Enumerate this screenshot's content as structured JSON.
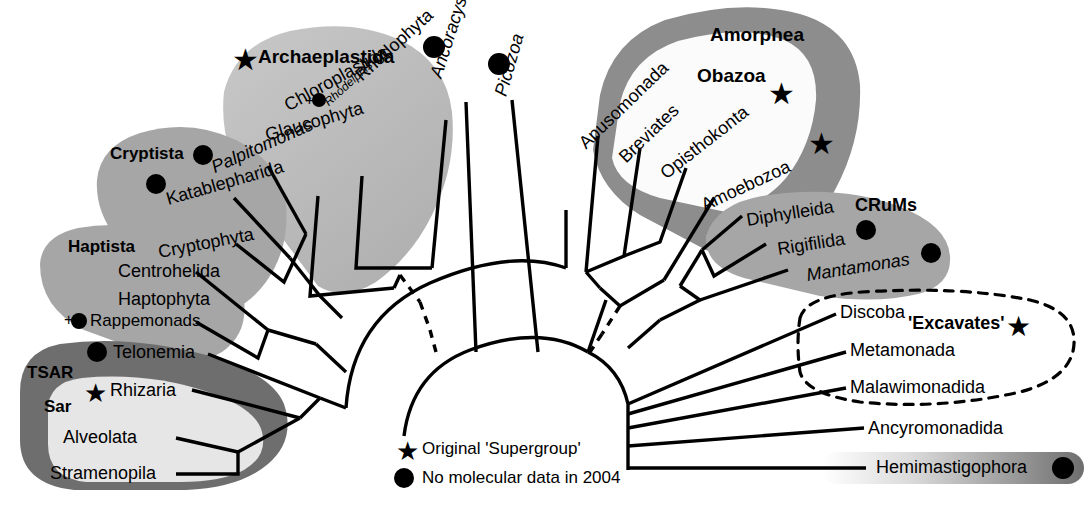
{
  "figure": {
    "type": "phylogenetic-tree",
    "layout": "radial-unrooted"
  },
  "legend": {
    "star_label": "Original 'Supergroup'",
    "dot_label": "No molecular data in 2004",
    "star_glyph": "★",
    "dot_glyph": "●"
  },
  "supergroups": {
    "archaeplastida": "Archaeplastida",
    "cryptista": "Cryptista",
    "haptista": "Haptista",
    "tsar": "TSAR",
    "sar": "Sar",
    "amorphea": "Amorphea",
    "obazoa": "Obazoa",
    "crums": "CRuMs",
    "excavates": "'Excavates'"
  },
  "taxa": {
    "rhodophyta": "Rhodophyta",
    "rhodelphis": "Rhodelphis",
    "chloroplastida": "Chloroplastida",
    "glaucophyta": "Glaucophyta",
    "palpitomonas": "Palpitomonas",
    "katablepharida": "Katablepharida",
    "cryptophyta": "Cryptophyta",
    "centrohelida": "Centrohelida",
    "haptophyta": "Haptophyta",
    "rappemonads": "Rappemonads",
    "telonemia": "Telonemia",
    "rhizaria": "Rhizaria",
    "alveolata": "Alveolata",
    "stramenopila": "Stramenopila",
    "ancoracysta": "Ancoracysta",
    "picozoa": "Picozoa",
    "apusomonada": "Apusomonada",
    "breviates": "Breviates",
    "opisthokonta": "Opisthokonta",
    "amoebozoa": "Amoebozoa",
    "diphylleida": "Diphylleida",
    "rigifilida": "Rigifilida",
    "mantamonas": "Mantamonas",
    "discoba": "Discoba",
    "metamonada": "Metamonada",
    "malawimonadida": "Malawimonadida",
    "ancyromonadida": "Ancyromonadida",
    "hemimastigophora": "Hemimastigophora"
  },
  "markers": {
    "plus": "+"
  },
  "colors": {
    "blob_dark": "#6e6e6e",
    "blob_mid": "#9a9a9a",
    "blob_light": "#c2c2c2",
    "blob_pale": "#e6e6e6",
    "line": "#000000"
  }
}
